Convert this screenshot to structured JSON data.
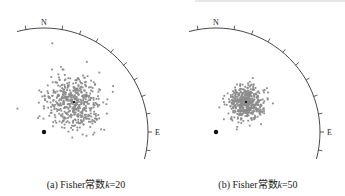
{
  "chart_data": [
    {
      "type": "scatter",
      "title": "",
      "caption_prefix": "(a) Fisher常数",
      "caption_var": "k",
      "caption_suffix": "=20",
      "kappa": 20,
      "labels": {
        "north": "N",
        "east": "E"
      },
      "net": {
        "type": "stereonet-quadrant",
        "tick_interval_deg": 10,
        "arc_from_deg": -15,
        "arc_to_deg": 105
      },
      "mean_direction_marker": "small black cross at cluster center",
      "reference_point": "large black dot lower-left",
      "point_color": "#8c8c8c",
      "n_points": 500,
      "spread_px": 14
    },
    {
      "type": "scatter",
      "title": "",
      "caption_prefix": "(b) Fisher常数",
      "caption_var": "k",
      "caption_suffix": "=50",
      "kappa": 50,
      "labels": {
        "north": "N",
        "east": "E"
      },
      "net": {
        "type": "stereonet-quadrant",
        "tick_interval_deg": 10,
        "arc_from_deg": -15,
        "arc_to_deg": 105
      },
      "mean_direction_marker": "small black cross at cluster center",
      "reference_point": "large black dot lower-left",
      "point_color": "#8c8c8c",
      "n_points": 500,
      "spread_px": 8.5
    }
  ]
}
